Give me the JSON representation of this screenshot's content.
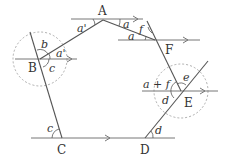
{
  "diagram": {
    "title": "",
    "points": [
      {
        "id": "A",
        "label": "A"
      },
      {
        "id": "B",
        "label": "B"
      },
      {
        "id": "C",
        "label": "C"
      },
      {
        "id": "D",
        "label": "D"
      },
      {
        "id": "E",
        "label": "E"
      },
      {
        "id": "F",
        "label": "F"
      }
    ],
    "angles": {
      "a_prime_A": "a'",
      "a_A": "a",
      "f_F": "f",
      "a_F": "a",
      "b_B": "b",
      "a_prime_B": "a'",
      "c_B": "c",
      "c_C": "c",
      "a_plus_f_E": "a + f",
      "e_E": "e",
      "d_E": "d",
      "d_D": "d"
    }
  }
}
